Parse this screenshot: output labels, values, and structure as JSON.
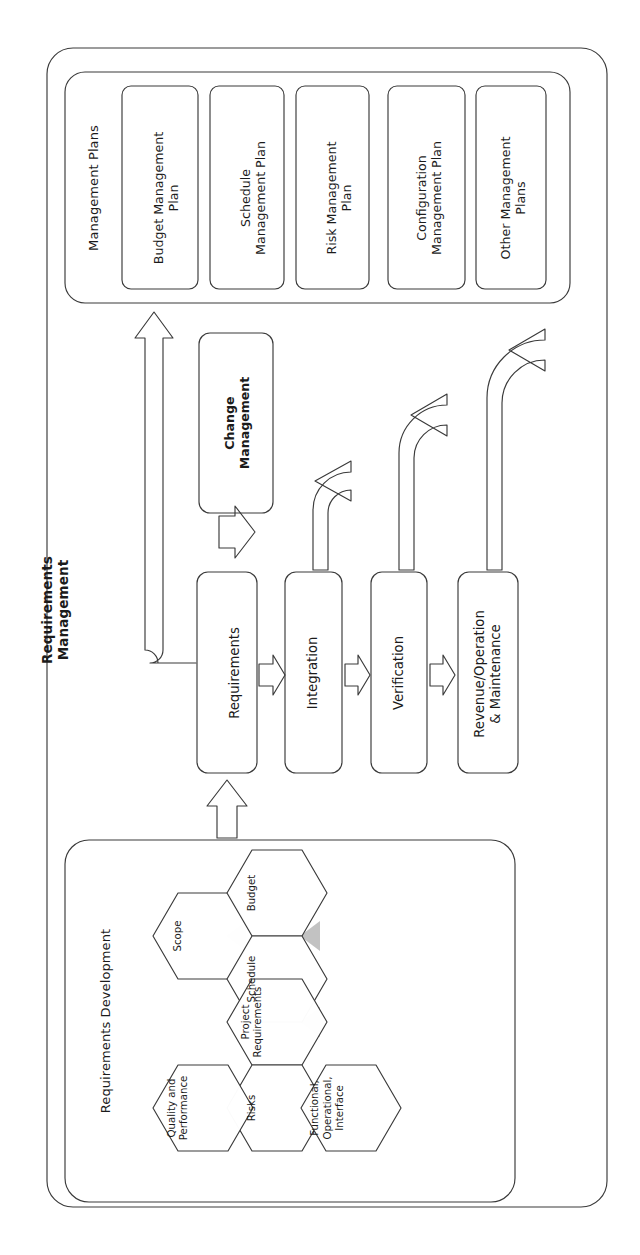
{
  "diagram": {
    "title": "Requirements Management",
    "orientation": "rotated-90-ccw",
    "ink_color": "#3a3a3a",
    "wedge_color": "#bfbfbf",
    "panels": {
      "management_plans": {
        "title": "Management Plans",
        "items": [
          "Budget Management\nPlan",
          "Schedule\nManagement Plan",
          "Risk Management\nPlan",
          "Configuration\nManagement Plan",
          "Other Management\nPlans"
        ]
      },
      "requirements_development": {
        "title": "Requirements Development",
        "hexagons": [
          {
            "label": "Scope"
          },
          {
            "label": "Budget"
          },
          {
            "label": "Schedule"
          },
          {
            "label": "Project\nRequirements"
          },
          {
            "label": "Risks"
          },
          {
            "label": "Quality and\nPerformance"
          },
          {
            "label": "Functional,\nOperational,\nInterface"
          }
        ]
      }
    },
    "change_management": {
      "label": "Change\nManagement"
    },
    "process_chain": [
      "Requirements",
      "Integration",
      "Verification",
      "Revenue/Operation\n& Maintenance"
    ],
    "connections": [
      {
        "from": "Requirements Development",
        "to": "Requirements",
        "style": "block-arrow"
      },
      {
        "from": "Requirements",
        "to": "Integration",
        "style": "block-arrow"
      },
      {
        "from": "Integration",
        "to": "Verification",
        "style": "block-arrow"
      },
      {
        "from": "Verification",
        "to": "Revenue/Operation & Maintenance",
        "style": "block-arrow"
      },
      {
        "from": "Change Management",
        "to": "Requirements",
        "style": "block-arrow"
      },
      {
        "from": "Integration",
        "to": "Change Management",
        "style": "curved-feedback"
      },
      {
        "from": "Verification",
        "to": "Change Management",
        "style": "curved-feedback"
      },
      {
        "from": "Revenue/Operation & Maintenance",
        "to": "Change Management",
        "style": "curved-feedback"
      },
      {
        "from": "Requirements",
        "to": "Management Plans",
        "style": "long-elbow-arrow"
      }
    ]
  }
}
